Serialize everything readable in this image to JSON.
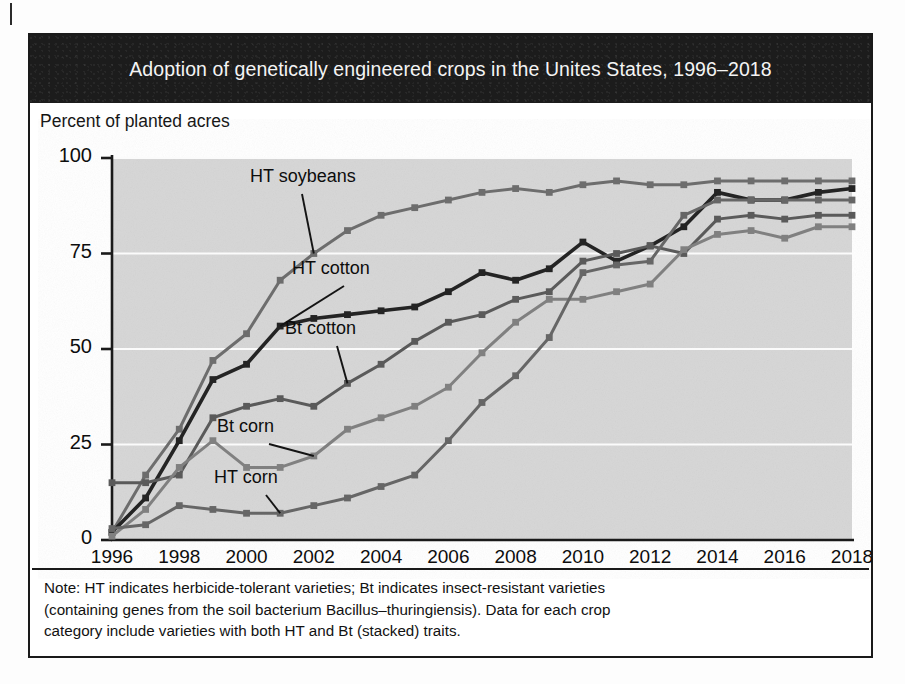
{
  "figure": {
    "title": "Adoption of genetically engineered crops in the Unites States, 1996–2018",
    "y_axis_caption": "Percent of planted acres",
    "note_lines": [
      "Note: HT indicates herbicide-tolerant varieties; Bt indicates insect-resistant varieties",
      "(containing genes from the soil bacterium Bacillus–thuringiensis). Data for each crop",
      "category include varieties with both HT and Bt (stacked) traits."
    ],
    "colors": {
      "title_bar": "#1c1c1c",
      "title_text": "#f4f4f4",
      "plot_background": "#d6d6d6",
      "gridline": "#fbfbfb",
      "axis": "#1a1a1a",
      "ht_soybeans": "#6d6d6d",
      "ht_cotton": "#242424",
      "bt_cotton": "#5a5a5a",
      "bt_corn": "#808080",
      "ht_corn": "#666666"
    }
  },
  "chart_data": {
    "type": "line",
    "title": "Adoption of genetically engineered crops in the Unites States, 1996–2018",
    "xlabel": "",
    "ylabel": "Percent of planted acres",
    "xlim": [
      1996,
      2018
    ],
    "ylim": [
      0,
      100
    ],
    "ytick_labels": [
      "0",
      "25",
      "50",
      "75",
      "100"
    ],
    "yticks": [
      0,
      25,
      50,
      75,
      100
    ],
    "xtick_labels": [
      "1996",
      "1998",
      "2000",
      "2002",
      "2004",
      "2006",
      "2008",
      "2010",
      "2012",
      "2014",
      "2016",
      "2018"
    ],
    "xticks": [
      1996,
      1998,
      2000,
      2002,
      2004,
      2006,
      2008,
      2010,
      2012,
      2014,
      2016,
      2018
    ],
    "grid": "horizontal",
    "legend": "inline-annotations",
    "x": [
      1996,
      1997,
      1998,
      1999,
      2000,
      2001,
      2002,
      2003,
      2004,
      2005,
      2006,
      2007,
      2008,
      2009,
      2010,
      2011,
      2012,
      2013,
      2014,
      2015,
      2016,
      2017,
      2018
    ],
    "series": [
      {
        "name": "HT soybeans",
        "color": "#6d6d6d",
        "values": [
          2,
          17,
          29,
          47,
          54,
          68,
          75,
          81,
          85,
          87,
          89,
          91,
          92,
          91,
          93,
          94,
          93,
          93,
          94,
          94,
          94,
          94,
          94
        ]
      },
      {
        "name": "HT cotton",
        "color": "#242424",
        "values": [
          2,
          11,
          26,
          42,
          46,
          56,
          58,
          59,
          60,
          61,
          65,
          70,
          68,
          71,
          78,
          73,
          77,
          82,
          91,
          89,
          89,
          91,
          92
        ]
      },
      {
        "name": "Bt cotton",
        "color": "#5a5a5a",
        "values": [
          15,
          15,
          17,
          32,
          35,
          37,
          35,
          41,
          46,
          52,
          57,
          59,
          63,
          65,
          73,
          75,
          77,
          75,
          84,
          85,
          84,
          85,
          85
        ]
      },
      {
        "name": "Bt corn",
        "color": "#808080",
        "values": [
          1,
          8,
          19,
          26,
          19,
          19,
          22,
          29,
          32,
          35,
          40,
          49,
          57,
          63,
          63,
          65,
          67,
          76,
          80,
          81,
          79,
          82,
          82
        ]
      },
      {
        "name": "HT corn",
        "color": "#666666",
        "values": [
          3,
          4,
          9,
          8,
          7,
          7,
          9,
          11,
          14,
          17,
          26,
          36,
          43,
          53,
          70,
          72,
          73,
          85,
          89,
          89,
          89,
          89,
          89
        ]
      }
    ],
    "annotations": [
      {
        "label": "HT soybeans",
        "label_x": 248,
        "label_y": 176,
        "point_x": 2002,
        "point_y": 75
      },
      {
        "label": "HT cotton",
        "label_x": 290,
        "label_y": 268,
        "point_x": 2001,
        "point_y": 56
      },
      {
        "label": "Bt cotton",
        "label_x": 283,
        "label_y": 328,
        "point_x": 2003,
        "point_y": 41
      },
      {
        "label": "Bt corn",
        "label_x": 215,
        "label_y": 426,
        "point_x": 2002,
        "point_y": 22
      },
      {
        "label": "HT corn",
        "label_x": 212,
        "label_y": 477,
        "point_x": 2001,
        "point_y": 7
      }
    ]
  }
}
